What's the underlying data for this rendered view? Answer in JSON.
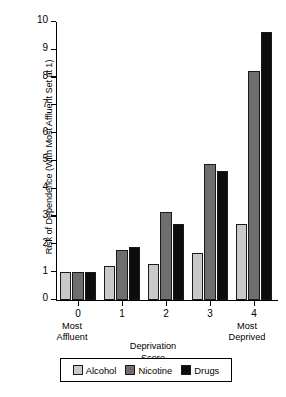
{
  "chart_data": {
    "type": "bar",
    "title": "",
    "xlabel": "Deprivation Score",
    "ylabel": "Risk of Dependence (With Most Affluent Set at 1)",
    "categories": [
      "0",
      "1",
      "2",
      "3",
      "4"
    ],
    "series": [
      {
        "name": "Alcohol",
        "values": [
          1.0,
          1.22,
          1.3,
          1.7,
          2.75
        ]
      },
      {
        "name": "Nicotine",
        "values": [
          1.0,
          1.79,
          3.15,
          4.9,
          8.25
        ]
      },
      {
        "name": "Drugs",
        "values": [
          1.0,
          1.92,
          2.74,
          4.63,
          9.65
        ]
      }
    ],
    "ylim": [
      0,
      10
    ],
    "yticks": [
      "0",
      "1",
      "2",
      "3",
      "4",
      "5",
      "6",
      "7",
      "8",
      "9",
      "10"
    ],
    "grid": false,
    "legend_position": "bottom",
    "colors": {
      "alcohol": "#c9c9c9",
      "nicotine": "#6e6e6e",
      "drugs": "#0d0d0d"
    },
    "axis_endcaps": {
      "left": "Most\nAffluent",
      "left_line1": "Most",
      "left_line2": "Affluent",
      "right_line1": "Most",
      "right_line2": "Deprived"
    },
    "xlabel_line1": "Deprivation",
    "xlabel_line2": "Score"
  },
  "legend": {
    "items": [
      {
        "label": "Alcohol"
      },
      {
        "label": "Nicotine"
      },
      {
        "label": "Drugs"
      }
    ]
  }
}
